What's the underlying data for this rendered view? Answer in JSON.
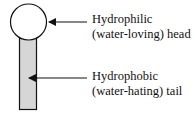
{
  "diagram": {
    "title": "",
    "head_label": {
      "line1": "Hydrophilic",
      "line2": "(water-loving) head"
    },
    "tail_label": {
      "line1": "Hydrophobic",
      "line2": "(water-hating) tail"
    },
    "colors": {
      "tail_fill": "#d6d6d6",
      "stroke": "#111111",
      "head_fill": "#ffffff"
    }
  }
}
